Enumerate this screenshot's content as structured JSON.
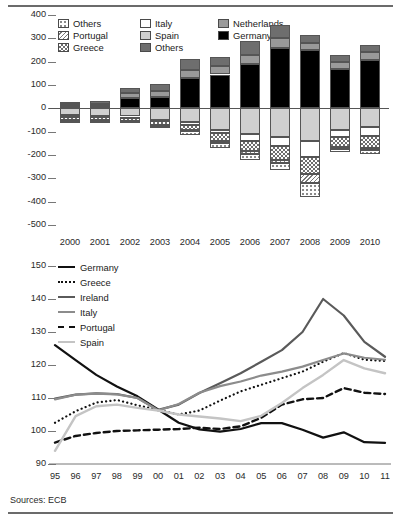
{
  "figure": {
    "title_partial": "",
    "source": "Sources: ECB"
  },
  "chart_data": [
    {
      "id": "top",
      "type": "bar",
      "stacked": true,
      "title": "",
      "xlabel": "",
      "ylabel": "",
      "ylim": [
        -500,
        400
      ],
      "yticks": [
        400,
        300,
        200,
        100,
        0,
        -100,
        -200,
        -300,
        -400,
        -500
      ],
      "ytick_labels": [
        "400",
        "300",
        "200",
        "100",
        "0",
        "-100",
        "-200",
        "-300",
        "-400",
        "-500"
      ],
      "grid": false,
      "legend_position": "top-left",
      "categories": [
        "2000",
        "2001",
        "2002",
        "2003",
        "2004",
        "2005",
        "2006",
        "2007",
        "2008",
        "2009",
        "2010"
      ],
      "series": [
        {
          "name": "Germany",
          "key": "germany",
          "color": "#000000",
          "pattern": "solid",
          "values": [
            12,
            10,
            45,
            50,
            130,
            145,
            190,
            258,
            252,
            170,
            207
          ]
        },
        {
          "name": "Netherlands",
          "key": "netherlands",
          "color": "#9a9a9a",
          "pattern": "solid",
          "values": [
            8,
            10,
            20,
            25,
            35,
            35,
            40,
            45,
            30,
            30,
            35
          ]
        },
        {
          "name": "Others",
          "key": "others_dark",
          "color": "#6e6e6e",
          "pattern": "solid",
          "values": [
            8,
            10,
            22,
            30,
            45,
            42,
            58,
            55,
            32,
            28,
            28
          ]
        },
        {
          "name": "Spain",
          "key": "spain",
          "color": "#cfcfcf",
          "pattern": "solid",
          "values": [
            -28,
            -32,
            -35,
            -48,
            -58,
            -92,
            -112,
            -122,
            -140,
            -92,
            -82
          ]
        },
        {
          "name": "Italy",
          "key": "italy",
          "color": "#ffffff",
          "pattern": "solid",
          "values": [
            -8,
            -5,
            -6,
            -8,
            -12,
            -14,
            -30,
            -38,
            -70,
            -32,
            -38
          ]
        },
        {
          "name": "Greece",
          "key": "greece",
          "color": "#6e6e6e",
          "pattern": "checker",
          "values": [
            -16,
            -14,
            -12,
            -14,
            -22,
            -36,
            -42,
            -62,
            -70,
            -42,
            -50
          ]
        },
        {
          "name": "Portugal",
          "key": "portugal",
          "color": "#7a7a7a",
          "pattern": "diagonal",
          "values": [
            -4,
            -3,
            -3,
            -4,
            -6,
            -8,
            -10,
            -12,
            -42,
            -8,
            -10
          ]
        },
        {
          "name": "Others",
          "key": "others_pat",
          "color": "#8a8a8a",
          "pattern": "dots",
          "values": [
            -2,
            -2,
            -2,
            -2,
            -18,
            -22,
            -28,
            -32,
            -60,
            -12,
            -14
          ]
        }
      ],
      "legend": [
        {
          "label": "Others",
          "swatch": "dots"
        },
        {
          "label": "Portugal",
          "swatch": "diagonal"
        },
        {
          "label": "Greece",
          "swatch": "checker"
        },
        {
          "label": "Italy",
          "swatch": "white"
        },
        {
          "label": "Spain",
          "swatch": "lightgray"
        },
        {
          "label": "Others",
          "swatch": "darkgray"
        },
        {
          "label": "Netherlands",
          "swatch": "midgray"
        },
        {
          "label": "Germany",
          "swatch": "black"
        }
      ]
    },
    {
      "id": "bottom",
      "type": "line",
      "title": "",
      "xlabel": "1995–2011",
      "ylabel": "",
      "ylim": [
        90,
        150
      ],
      "yticks": [
        150,
        140,
        130,
        120,
        110,
        100,
        90
      ],
      "ytick_labels": [
        "150",
        "140",
        "130",
        "120",
        "110",
        "100",
        "90"
      ],
      "grid": false,
      "legend_position": "top-left",
      "x": [
        "95",
        "96",
        "97",
        "98",
        "99",
        "00",
        "01",
        "02",
        "03",
        "04",
        "05",
        "06",
        "07",
        "08",
        "09",
        "10",
        "11"
      ],
      "series": [
        {
          "name": "Germany",
          "color": "#111111",
          "style": "solid",
          "width": 2.2,
          "values": [
            126.0,
            121.5,
            117.0,
            113.5,
            110.5,
            106.5,
            102.5,
            100.5,
            99.8,
            100.6,
            102.4,
            102.4,
            100.4,
            98.0,
            99.6,
            96.6,
            96.4
          ]
        },
        {
          "name": "Greece",
          "color": "#111111",
          "style": "dotted",
          "width": 2.2,
          "values": [
            102.5,
            106.0,
            108.6,
            109.4,
            107.8,
            106.4,
            105.0,
            106.2,
            109.2,
            112.0,
            114.0,
            116.0,
            118.0,
            121.0,
            123.6,
            121.6,
            121.2
          ]
        },
        {
          "name": "Ireland",
          "color": "#5a5a5a",
          "style": "solid",
          "width": 2.2,
          "values": [
            109.8,
            111.0,
            111.4,
            111.2,
            110.0,
            106.4,
            108.0,
            111.5,
            114.5,
            117.5,
            121.0,
            124.5,
            130.0,
            140.0,
            135.0,
            127.0,
            122.5
          ]
        },
        {
          "name": "Italy",
          "color": "#8c8c8c",
          "style": "solid",
          "width": 2.2,
          "values": [
            109.6,
            111.0,
            111.3,
            111.1,
            110.0,
            106.2,
            108.2,
            111.6,
            113.6,
            115.0,
            116.8,
            118.0,
            119.5,
            121.5,
            123.5,
            122.2,
            121.6
          ]
        },
        {
          "name": "Portugal",
          "color": "#111111",
          "style": "dashed",
          "width": 2.4,
          "values": [
            96.5,
            98.5,
            99.4,
            100.0,
            100.2,
            100.4,
            100.6,
            101.0,
            100.6,
            101.4,
            104.0,
            108.0,
            109.6,
            110.0,
            113.0,
            111.6,
            111.2
          ]
        },
        {
          "name": "Spain",
          "color": "#c4c4c4",
          "style": "solid",
          "width": 2.4,
          "values": [
            94.0,
            104.5,
            107.5,
            108.0,
            107.0,
            106.2,
            105.0,
            104.4,
            103.8,
            103.0,
            104.6,
            108.5,
            113.0,
            117.0,
            121.5,
            119.0,
            117.5
          ]
        }
      ],
      "legend": [
        {
          "label": "Germany",
          "style": "solid",
          "color": "#111111"
        },
        {
          "label": "Greece",
          "style": "dotted",
          "color": "#111111"
        },
        {
          "label": "Ireland",
          "style": "solid",
          "color": "#5a5a5a"
        },
        {
          "label": "Italy",
          "style": "solid",
          "color": "#8c8c8c"
        },
        {
          "label": "Portugal",
          "style": "dashed",
          "color": "#111111"
        },
        {
          "label": "Spain",
          "style": "solid",
          "color": "#c4c4c4"
        }
      ]
    }
  ]
}
